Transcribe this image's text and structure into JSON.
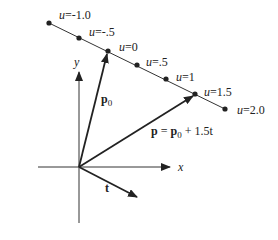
{
  "figure": {
    "axes": {
      "x_label": "x",
      "y_label": "y"
    },
    "vectors": {
      "p0_label": "p",
      "p0_sub": "0",
      "t_label": "t",
      "p_label_a": "p",
      "p_label_eq": " = ",
      "p_label_b": "p",
      "p_label_sub": "0",
      "p_label_rest": " + 1.5t"
    },
    "points": [
      {
        "u_var": "u",
        "u_val": "=-1.0"
      },
      {
        "u_var": "u",
        "u_val": "=-.5"
      },
      {
        "u_var": "u",
        "u_val": "=0"
      },
      {
        "u_var": "u",
        "u_val": "=.5"
      },
      {
        "u_var": "u",
        "u_val": "=1"
      },
      {
        "u_var": "u",
        "u_val": "=1.5"
      },
      {
        "u_var": "u",
        "u_val": "=2.0"
      }
    ]
  }
}
